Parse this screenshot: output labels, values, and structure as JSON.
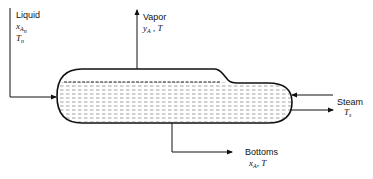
{
  "diagram": {
    "type": "process-flow",
    "title": "",
    "vessel": {
      "name": "evaporator-vessel",
      "fill_pattern": "dashed liquid hatch"
    },
    "streams": {
      "liquid": {
        "label": "Liquid",
        "var1_main": "x",
        "var1_sub": "A",
        "var1_subsub": "n",
        "var2_main": "T",
        "var2_sub": "n",
        "direction": "in"
      },
      "vapor": {
        "label": "Vapor",
        "var_main": "y",
        "var_sub": "A",
        "sep": " , ",
        "var2": "T",
        "direction": "out"
      },
      "steam": {
        "label": "Steam",
        "var_main": "T",
        "var_sub": "s",
        "direction": "in-out"
      },
      "bottoms": {
        "label": "Bottoms",
        "var_main": "x",
        "var_sub": "A",
        "sep": ", ",
        "var2": "T",
        "direction": "out"
      }
    },
    "colors": {
      "line": "#111111",
      "hatch": "#777777",
      "background": "#ffffff"
    }
  }
}
